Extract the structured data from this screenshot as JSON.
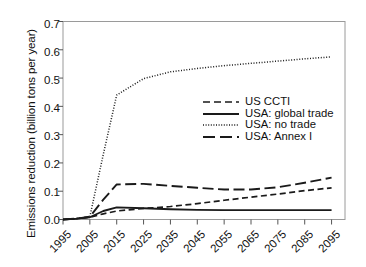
{
  "chart_data": {
    "type": "line",
    "title": "",
    "xlabel": "",
    "ylabel": "Emissions reduction (billion tons per year)",
    "xlim": [
      1995,
      2100
    ],
    "ylim": [
      0.0,
      0.7
    ],
    "grid": false,
    "legend_position": "center-right",
    "xticks": [
      "1995",
      "2005",
      "2015",
      "2025",
      "2035",
      "2045",
      "2055",
      "2065",
      "2075",
      "2085",
      "2095"
    ],
    "xtick_values": [
      1995,
      2005,
      2015,
      2025,
      2035,
      2045,
      2055,
      2065,
      2075,
      2085,
      2095
    ],
    "yticks": [
      "0.0",
      "0.1",
      "0.2",
      "0.3",
      "0.4",
      "0.5",
      "0.6",
      "0.7"
    ],
    "ytick_values": [
      0.0,
      0.1,
      0.2,
      0.3,
      0.4,
      0.5,
      0.6,
      0.7
    ],
    "x": [
      1995,
      2000,
      2005,
      2010,
      2015,
      2025,
      2035,
      2045,
      2055,
      2065,
      2075,
      2085,
      2095
    ],
    "series": [
      {
        "name": "US CCTI",
        "style": "dashed",
        "color": "#1a1a1a",
        "values": [
          0.0,
          0.003,
          0.008,
          0.02,
          0.03,
          0.039,
          0.046,
          0.056,
          0.068,
          0.079,
          0.09,
          0.102,
          0.112
        ]
      },
      {
        "name": "USA: global trade",
        "style": "solid",
        "color": "#1a1a1a",
        "values": [
          0.0,
          0.003,
          0.008,
          0.03,
          0.043,
          0.04,
          0.036,
          0.034,
          0.033,
          0.033,
          0.033,
          0.033,
          0.033
        ]
      },
      {
        "name": "USA: no trade",
        "style": "dotted",
        "color": "#1a1a1a",
        "values": [
          0.0,
          0.003,
          0.01,
          0.23,
          0.44,
          0.498,
          0.522,
          0.534,
          0.544,
          0.552,
          0.56,
          0.568,
          0.575
        ]
      },
      {
        "name": "USA: Annex I",
        "style": "longdash",
        "color": "#1a1a1a",
        "values": [
          0.0,
          0.003,
          0.01,
          0.07,
          0.124,
          0.126,
          0.119,
          0.112,
          0.106,
          0.106,
          0.114,
          0.13,
          0.148
        ]
      }
    ]
  },
  "legend": {
    "items": [
      {
        "label": "US CCTI",
        "dash": "7,4",
        "width": 1.6
      },
      {
        "label": "USA: global trade",
        "dash": "0",
        "width": 1.9
      },
      {
        "label": "USA: no trade",
        "dash": "1,1.6",
        "width": 1.5
      },
      {
        "label": "USA: Annex I",
        "dash": "12,5",
        "width": 1.9
      }
    ]
  },
  "axes": {
    "frame_color": "#9a9a9a",
    "tick_color": "#555555"
  }
}
